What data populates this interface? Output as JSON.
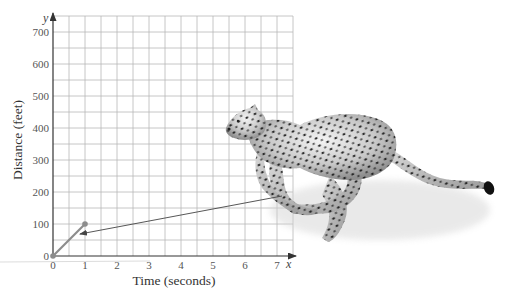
{
  "chart_data": {
    "type": "line",
    "title": "",
    "xlabel": "Time (seconds)",
    "ylabel": "Distance (feet)",
    "x_axis_var": "x",
    "y_axis_var": "y",
    "xlim": [
      0,
      7.5
    ],
    "ylim": [
      0,
      750
    ],
    "x_ticks": [
      0,
      1,
      2,
      3,
      4,
      5,
      6,
      7
    ],
    "y_ticks": [
      0,
      100,
      200,
      300,
      400,
      500,
      600,
      700
    ],
    "x_tick_labels": [
      "0",
      "1",
      "2",
      "3",
      "4",
      "5",
      "6",
      "7"
    ],
    "y_tick_labels": [
      "0",
      "100",
      "200",
      "300",
      "400",
      "500",
      "600",
      "700"
    ],
    "grid": true,
    "grid_minor_x_step": 0.5,
    "grid_minor_y_step": 50,
    "series": [
      {
        "name": "Cheetah distance",
        "x": [
          0,
          1
        ],
        "y": [
          0,
          100
        ],
        "color": "#8c8c8c",
        "markers": "filled-circle"
      }
    ],
    "annotations": [
      {
        "type": "arrow",
        "from": "cheetah illustration",
        "to_point": [
          1,
          70
        ],
        "description": "arrow from running cheetah pointing to plotted segment"
      }
    ],
    "illustration": "running cheetah"
  },
  "labels": {
    "x_title": "Time (seconds)",
    "y_title": "Distance (feet)",
    "x_var": "x",
    "y_var": "y"
  },
  "colors": {
    "grid": "#b8b8b8",
    "axis": "#333333",
    "series": "#8c8c8c",
    "arrow": "#444444"
  }
}
